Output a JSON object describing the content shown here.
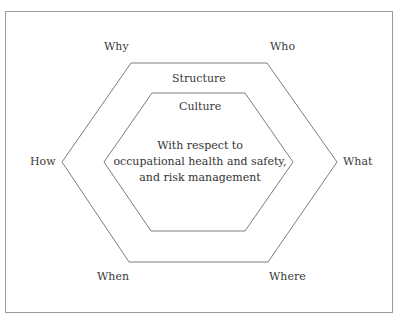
{
  "diagram": {
    "outer_labels": {
      "why": "Why",
      "who": "Who",
      "how": "How",
      "what": "What",
      "when": "When",
      "where": "Where"
    },
    "outer_ring_label": "Structure",
    "inner_ring_label": "Culture",
    "center_text": {
      "line1": "With respect to",
      "line2": "occupational health and safety,",
      "line3": "and risk management"
    },
    "colors": {
      "line": "#6e6e6e",
      "frame": "#9a9a9a",
      "text": "#333333"
    }
  }
}
